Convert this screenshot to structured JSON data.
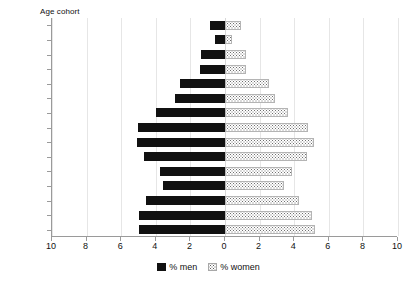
{
  "chart_data": {
    "type": "bar",
    "subtype": "population-pyramid",
    "title": "Age cohort",
    "xlabel": "",
    "ylabel": "Age cohort",
    "xlim": [
      -10,
      10
    ],
    "xticks": [
      10,
      8,
      6,
      4,
      2,
      0,
      2,
      4,
      6,
      8,
      10
    ],
    "grid": true,
    "legend_position": "bottom-center",
    "categories": [
      70,
      65,
      60,
      55,
      50,
      45,
      40,
      35,
      30,
      25,
      20,
      15,
      10,
      5,
      0
    ],
    "series": [
      {
        "name": "% men",
        "side": "left",
        "color": "#111111",
        "values": [
          0.85,
          0.55,
          1.4,
          1.45,
          2.6,
          2.9,
          4.0,
          5.05,
          5.1,
          4.7,
          3.75,
          3.6,
          4.55,
          4.95,
          4.95
        ]
      },
      {
        "name": "% women",
        "side": "right",
        "color": "#ffffff",
        "pattern": "dotted",
        "values": [
          0.95,
          0.4,
          1.2,
          1.2,
          2.55,
          2.9,
          3.65,
          4.8,
          5.15,
          4.75,
          3.85,
          3.4,
          4.3,
          5.0,
          5.2
        ]
      }
    ],
    "legend": [
      {
        "label": "% men",
        "swatch": "solid-black"
      },
      {
        "label": "% women",
        "swatch": "dotted-white"
      }
    ]
  },
  "axes": {
    "y_tick_labels": [
      "70",
      "65",
      "60",
      "55",
      "50",
      "45",
      "40",
      "35",
      "30",
      "25",
      "20",
      "15",
      "10",
      "5",
      "0"
    ],
    "x_tick_labels": [
      "10",
      "8",
      "6",
      "4",
      "2",
      "0",
      "2",
      "4",
      "6",
      "8",
      "10"
    ]
  },
  "colors": {
    "men": "#111111",
    "women_dots": "#6e6e6e",
    "grid": "#e6e6e6",
    "axis": "#9a9a9a",
    "background": "#ffffff",
    "text": "#111111"
  }
}
